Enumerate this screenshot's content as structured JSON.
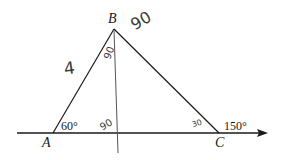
{
  "diagram": {
    "type": "geometry-triangle",
    "colors": {
      "ink": "#1a1a1a",
      "handwriting": "#3a3a3a",
      "background": "#ffffff"
    },
    "vertices": [
      {
        "id": "A",
        "label": "A"
      },
      {
        "id": "B",
        "label": "B"
      },
      {
        "id": "C",
        "label": "C"
      }
    ],
    "printed_angles": {
      "angle_A": "60°",
      "exterior_C": "150°"
    },
    "handwritten": {
      "side_AB": "4",
      "near_B": "90",
      "upper_B_split": "90",
      "foot_of_altitude": "90",
      "angle_C_interior": "30"
    },
    "lines": [
      {
        "name": "baseline",
        "description": "horizontal line through A and C, arrow pointing right"
      },
      {
        "name": "side-AB"
      },
      {
        "name": "side-BC"
      },
      {
        "name": "altitude-from-B",
        "description": "hand-drawn vertical line from B down through the baseline"
      }
    ]
  }
}
